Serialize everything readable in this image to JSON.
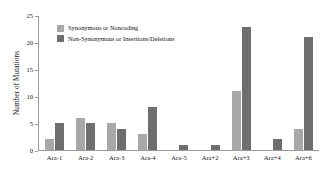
{
  "chart_data": {
    "type": "bar",
    "title": "",
    "xlabel": "",
    "ylabel": "Number of Mutations",
    "ylim": [
      0,
      25
    ],
    "yticks": [
      0,
      5,
      10,
      15,
      20,
      25
    ],
    "ytick_labels": [
      "0",
      "5",
      "10",
      "15",
      "20",
      "25"
    ],
    "grid": false,
    "legend_position": "upper left inside plot area",
    "categories": [
      "Ara-1",
      "Ara-2",
      "Ara-3",
      "Ara-4",
      "Ara-5",
      "Ara+2",
      "Ara+3",
      "Ara+4",
      "Ara+6"
    ],
    "series": [
      {
        "name": "Synonymous or Noncoding",
        "color": "#a8a8a8",
        "values": [
          2,
          6,
          5,
          3,
          0,
          0,
          11,
          0,
          4
        ]
      },
      {
        "name": "Non-Synonymous or Insertions/Deletions",
        "color": "#6e6e6e",
        "values": [
          5,
          5,
          4,
          8,
          1,
          1,
          23,
          2,
          21
        ]
      }
    ]
  }
}
